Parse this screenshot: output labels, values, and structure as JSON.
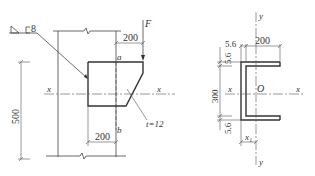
{
  "left_view": {
    "weld_symbol": "8",
    "force_label": "F",
    "top_dim": "200",
    "bottom_dim": "200",
    "height_dim": "500",
    "point_a": "a",
    "point_b": "b",
    "axis_left": "x",
    "axis_right": "x",
    "thickness": "t=12"
  },
  "right_view": {
    "axis_y_top": "y",
    "axis_y_bottom": "y",
    "axis_x_left": "x",
    "axis_x_right": "x",
    "origin": "O",
    "flange_width_dim": "200",
    "web_thickness_dim": "5.6",
    "top_flange_dim": "5.6",
    "bottom_flange_dim": "5.6",
    "height_dim": "300",
    "centroid_dim": "x₁"
  },
  "colors": {
    "line": "#333333",
    "background": "#ffffff"
  }
}
